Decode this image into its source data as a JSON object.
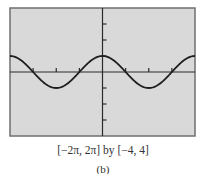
{
  "chart_data": {
    "type": "line",
    "title": "",
    "function": "y = cos x",
    "xlabel": "",
    "ylabel": "",
    "xlim": [
      -6.2832,
      6.2832
    ],
    "ylim": [
      -4,
      4
    ],
    "x_tick_step": 1.5708,
    "y_tick_step": 1,
    "grid": false,
    "series": [
      {
        "name": "cos x",
        "x": [
          -6.2832,
          -4.7124,
          -3.1416,
          -1.5708,
          0,
          1.5708,
          3.1416,
          4.7124,
          6.2832
        ],
        "values": [
          1,
          0,
          -1,
          0,
          1,
          0,
          -1,
          0,
          1
        ]
      }
    ],
    "caption": "[−2π, 2π] by [−4, 4]",
    "sublabel": "(b)"
  },
  "colors": {
    "screen_background": "#d9d9d9",
    "frame": "#6f6f6f",
    "curve": "#1e1e1e",
    "axes": "#2a2a2a"
  },
  "screen": {
    "left": 10,
    "top": 8,
    "right": 195,
    "bottom": 136
  }
}
